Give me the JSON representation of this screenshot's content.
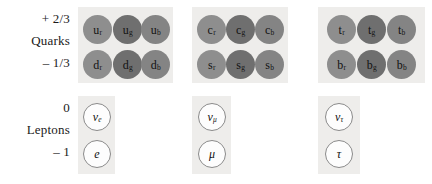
{
  "figure": {
    "background": "#ffffff",
    "panel_color": "#eeedeb",
    "quark_disc_colors": {
      "r": "#8e8e8e",
      "g": "#6f6f6f",
      "b": "#848484"
    },
    "lepton_circle_fill": "#fdfdfd",
    "lepton_circle_border": "#8a8a8a"
  },
  "rows": {
    "quarks": {
      "family_label": "Quarks",
      "charge_top": "+ 2/3",
      "charge_bottom": "– 1/3"
    },
    "leptons": {
      "family_label": "Leptons",
      "charge_top": "0",
      "charge_bottom": "– 1"
    }
  },
  "quark_generations": [
    {
      "name": "generation-1",
      "up_type": [
        {
          "symbol": "u",
          "subscript": "r",
          "color": "r"
        },
        {
          "symbol": "u",
          "subscript": "g",
          "color": "g"
        },
        {
          "symbol": "u",
          "subscript": "b",
          "color": "b"
        }
      ],
      "down_type": [
        {
          "symbol": "d",
          "subscript": "r",
          "color": "r"
        },
        {
          "symbol": "d",
          "subscript": "g",
          "color": "g"
        },
        {
          "symbol": "d",
          "subscript": "b",
          "color": "b"
        }
      ]
    },
    {
      "name": "generation-2",
      "up_type": [
        {
          "symbol": "c",
          "subscript": "r",
          "color": "r"
        },
        {
          "symbol": "c",
          "subscript": "g",
          "color": "g"
        },
        {
          "symbol": "c",
          "subscript": "b",
          "color": "b"
        }
      ],
      "down_type": [
        {
          "symbol": "s",
          "subscript": "r",
          "color": "r"
        },
        {
          "symbol": "s",
          "subscript": "g",
          "color": "g"
        },
        {
          "symbol": "s",
          "subscript": "b",
          "color": "b"
        }
      ]
    },
    {
      "name": "generation-3",
      "up_type": [
        {
          "symbol": "t",
          "subscript": "r",
          "color": "r"
        },
        {
          "symbol": "t",
          "subscript": "g",
          "color": "g"
        },
        {
          "symbol": "t",
          "subscript": "b",
          "color": "b"
        }
      ],
      "down_type": [
        {
          "symbol": "b",
          "subscript": "r",
          "color": "r"
        },
        {
          "symbol": "b",
          "subscript": "g",
          "color": "g"
        },
        {
          "symbol": "b",
          "subscript": "b",
          "color": "b"
        }
      ]
    }
  ],
  "lepton_generations": [
    {
      "name": "generation-1",
      "neutral": {
        "symbol": "ν",
        "subscript": "e"
      },
      "charged": {
        "symbol": "e",
        "subscript": ""
      }
    },
    {
      "name": "generation-2",
      "neutral": {
        "symbol": "ν",
        "subscript": "μ"
      },
      "charged": {
        "symbol": "μ",
        "subscript": ""
      }
    },
    {
      "name": "generation-3",
      "neutral": {
        "symbol": "ν",
        "subscript": "τ"
      },
      "charged": {
        "symbol": "τ",
        "subscript": ""
      }
    }
  ]
}
